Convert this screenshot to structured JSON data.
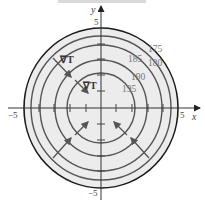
{
  "figure": {
    "type": "contour diagram of temperature with gradient vectors",
    "axes": {
      "x_label": "x",
      "y_label": "y",
      "x_ticks": {
        "min_label": "−5",
        "max_label": "5"
      },
      "y_ticks": {
        "min_label": "−5",
        "max_label": "5"
      }
    },
    "contours": [
      {
        "level": "175"
      },
      {
        "level": "180"
      },
      {
        "level": "185"
      },
      {
        "level": "190"
      },
      {
        "level": "195"
      }
    ],
    "gradient_labels": [
      {
        "text": "∇T"
      },
      {
        "text": "∇T"
      }
    ],
    "colors": {
      "fill": "#ececec",
      "contour": "#555555",
      "boundary": "#1a1a1a",
      "axis": "#333333",
      "label": "#777777"
    }
  }
}
